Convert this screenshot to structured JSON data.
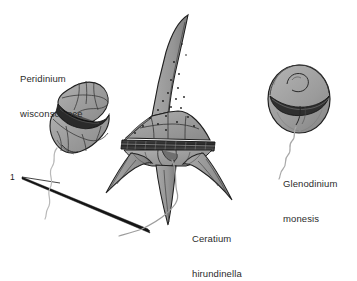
{
  "figure": {
    "background_color": "#ffffff",
    "ink_color": "#1a1a1a",
    "cell_fill": "#9a9a9a",
    "cell_fill_light": "#b4b4b4",
    "cell_fill_dark": "#6e6e6e",
    "flagellum_color": "#b0b0b0",
    "text_color": "#2b2b2b"
  },
  "scale": {
    "number": "1",
    "description": "wedge pointer"
  },
  "labels": {
    "peridinium": {
      "line1": "Peridinium",
      "line2": "wisconscience"
    },
    "ceratium": {
      "line1": "Ceratium",
      "line2": "hirundinella"
    },
    "glenodinium": {
      "line1": "Glenodinium",
      "line2": "monesis"
    }
  },
  "organisms": [
    {
      "name": "Peridinium wisconscience",
      "shape": "angular armored cell with plate sutures and girdle",
      "has_flagellum": true
    },
    {
      "name": "Ceratium hirundinella",
      "shape": "cell with long apical horn, pores and three antapical horns",
      "has_flagellum": true
    },
    {
      "name": "Glenodinium monesis",
      "shape": "rounded cell with girdle groove",
      "has_flagellum": true
    }
  ]
}
